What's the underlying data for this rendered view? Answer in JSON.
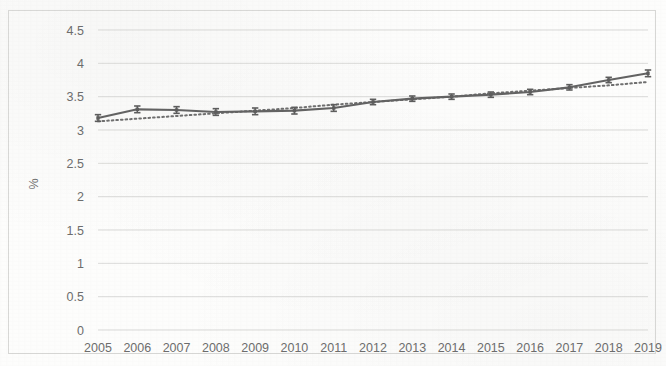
{
  "chart_data": {
    "type": "line",
    "title": "",
    "xlabel": "",
    "ylabel": "%",
    "categories": [
      "2005",
      "2006",
      "2007",
      "2008",
      "2009",
      "2010",
      "2011",
      "2012",
      "2013",
      "2014",
      "2015",
      "2016",
      "2017",
      "2018",
      "2019"
    ],
    "x": [
      2005,
      2006,
      2007,
      2008,
      2009,
      2010,
      2011,
      2012,
      2013,
      2014,
      2015,
      2016,
      2017,
      2018,
      2019
    ],
    "ylim": [
      0,
      4.5
    ],
    "ytick_labels": [
      "0",
      "0.5",
      "1",
      "1.5",
      "2",
      "2.5",
      "3",
      "3.5",
      "4",
      "4.5"
    ],
    "ytick_values": [
      0,
      0.5,
      1,
      1.5,
      2,
      2.5,
      3,
      3.5,
      4,
      4.5
    ],
    "grid": "horizontal",
    "legend": "none",
    "series": [
      {
        "name": "observed",
        "style": "solid-with-markers-and-error-bars",
        "color": "#5d5d5d",
        "values": [
          3.18,
          3.31,
          3.3,
          3.27,
          3.28,
          3.29,
          3.33,
          3.42,
          3.47,
          3.5,
          3.53,
          3.57,
          3.64,
          3.75,
          3.85
        ],
        "error": [
          0.05,
          0.05,
          0.05,
          0.05,
          0.05,
          0.05,
          0.05,
          0.04,
          0.04,
          0.04,
          0.04,
          0.04,
          0.04,
          0.04,
          0.05
        ]
      },
      {
        "name": "trend",
        "style": "dotted",
        "color": "#6f6f6f",
        "values": [
          3.13,
          3.17,
          3.21,
          3.25,
          3.29,
          3.33,
          3.38,
          3.42,
          3.46,
          3.5,
          3.55,
          3.59,
          3.63,
          3.67,
          3.72
        ]
      }
    ]
  },
  "colors": {
    "series": "#5d5d5d",
    "trend": "#6f6f6f",
    "gridline": "#d5d5d3",
    "tick_text": "#6d6d6d",
    "frame": "#d8d8d6",
    "background": "#fdfdfc"
  }
}
